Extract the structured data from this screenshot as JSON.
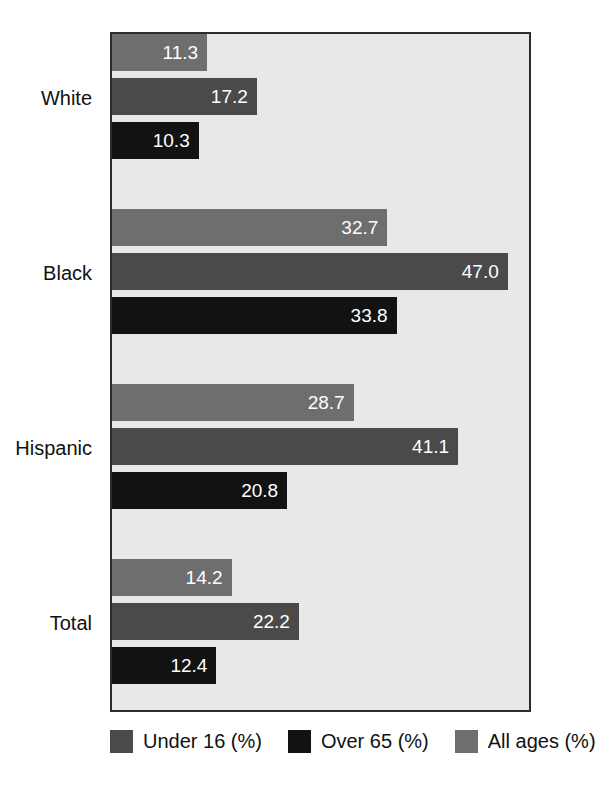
{
  "chart_data": {
    "type": "bar",
    "orientation": "horizontal",
    "title": "",
    "subtitle": "",
    "xlabel": "",
    "ylabel": "",
    "xlim": [
      0,
      50
    ],
    "grid": false,
    "legend_position": "bottom",
    "categories": [
      "White",
      "Black",
      "Hispanic",
      "Total"
    ],
    "series": [
      {
        "name": "All ages (%)",
        "color": "#6e6e6e",
        "values": [
          11.3,
          32.7,
          28.7,
          14.2
        ],
        "labels": [
          "11.3",
          "32.7",
          "28.7",
          "14.2"
        ]
      },
      {
        "name": "Under 16 (%)",
        "color": "#4a4a4a",
        "values": [
          17.2,
          47.0,
          41.1,
          22.2
        ],
        "labels": [
          "17.2",
          "47.0",
          "41.1",
          "22.2"
        ]
      },
      {
        "name": "Over 65 (%)",
        "color": "#121212",
        "values": [
          10.3,
          33.8,
          20.8,
          12.4
        ],
        "labels": [
          "10.3",
          "33.8",
          "20.8",
          "12.4"
        ]
      }
    ],
    "bar_order_top_to_bottom": [
      "All ages (%)",
      "Under 16 (%)",
      "Over 65 (%)"
    ],
    "legend": [
      {
        "label": "Under 16 (%)",
        "color": "#4a4a4a"
      },
      {
        "label": "Over 65 (%)",
        "color": "#121212"
      },
      {
        "label": "All ages (%)",
        "color": "#6e6e6e"
      }
    ],
    "plot_background": "#e8e8e8",
    "frame_color": "#2b2b2b",
    "value_label_color": "#ffffff"
  },
  "axis": {
    "category_labels": [
      "White",
      "Black",
      "Hispanic",
      "Total"
    ]
  },
  "bars": [
    {
      "group": "White",
      "series": "All ages (%)",
      "value": "11.3"
    },
    {
      "group": "White",
      "series": "Under 16 (%)",
      "value": "17.2"
    },
    {
      "group": "White",
      "series": "Over 65 (%)",
      "value": "10.3"
    },
    {
      "group": "Black",
      "series": "All ages (%)",
      "value": "32.7"
    },
    {
      "group": "Black",
      "series": "Under 16 (%)",
      "value": "47.0"
    },
    {
      "group": "Black",
      "series": "Over 65 (%)",
      "value": "33.8"
    },
    {
      "group": "Hispanic",
      "series": "All ages (%)",
      "value": "28.7"
    },
    {
      "group": "Hispanic",
      "series": "Under 16 (%)",
      "value": "41.1"
    },
    {
      "group": "Hispanic",
      "series": "Over 65 (%)",
      "value": "20.8"
    },
    {
      "group": "Total",
      "series": "All ages (%)",
      "value": "14.2"
    },
    {
      "group": "Total",
      "series": "Under 16 (%)",
      "value": "22.2"
    },
    {
      "group": "Total",
      "series": "Over 65 (%)",
      "value": "12.4"
    }
  ]
}
